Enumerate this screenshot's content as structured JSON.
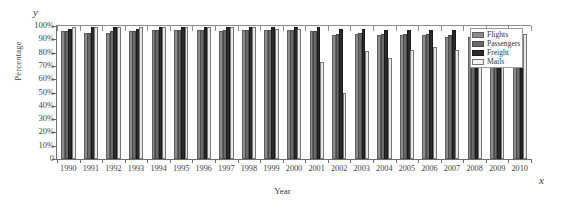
{
  "chart_data": {
    "type": "bar",
    "title": "",
    "xlabel": "Year",
    "ylabel": "Percentage",
    "x_axis_letter": "y",
    "y_axis_letter": "x",
    "ylim": [
      0,
      100
    ],
    "grid": false,
    "legend_position": "top-right",
    "ytick_labels": [
      "0",
      "10%",
      "20%",
      "30%",
      "40%",
      "50%",
      "60%",
      "70%",
      "80%",
      "90%",
      "100%"
    ],
    "ytick_values": [
      0,
      10,
      20,
      30,
      40,
      50,
      60,
      70,
      80,
      90,
      100
    ],
    "categories": [
      "1990",
      "1991",
      "1992",
      "1993",
      "1994",
      "1995",
      "1996",
      "1997",
      "1998",
      "1999",
      "2000",
      "2001",
      "2002",
      "2003",
      "2004",
      "2005",
      "2006",
      "2007",
      "2008",
      "2009",
      "2010"
    ],
    "series": [
      {
        "name": "Flights",
        "color": "#8c8c8c",
        "values": [
          96,
          95,
          95,
          96,
          97,
          97,
          97,
          96,
          97,
          97,
          97,
          96,
          93,
          94,
          93,
          93,
          93,
          92,
          92,
          96,
          95
        ]
      },
      {
        "name": "Passengers",
        "color": "#6a6a6a",
        "values": [
          96,
          95,
          96,
          96,
          97,
          97,
          97,
          97,
          97,
          97,
          97,
          96,
          94,
          95,
          94,
          94,
          94,
          93,
          93,
          97,
          96
        ]
      },
      {
        "name": "Freight",
        "color": "#2a2a2a",
        "values": [
          98,
          99,
          99,
          98,
          99,
          99,
          99,
          99,
          99,
          99,
          99,
          99,
          98,
          98,
          97,
          97,
          97,
          97,
          96,
          98,
          98
        ]
      },
      {
        "name": "Mails",
        "color": "#e8e8e8",
        "values": [
          99,
          99,
          99,
          99,
          99,
          99,
          99,
          99,
          99,
          98,
          98,
          73,
          50,
          81,
          76,
          82,
          84,
          82,
          78,
          75,
          94
        ]
      }
    ]
  },
  "legend": {
    "items": [
      {
        "label": "Flights"
      },
      {
        "label": "Passengers"
      },
      {
        "label": "Freight"
      },
      {
        "label": "Mails"
      }
    ]
  }
}
